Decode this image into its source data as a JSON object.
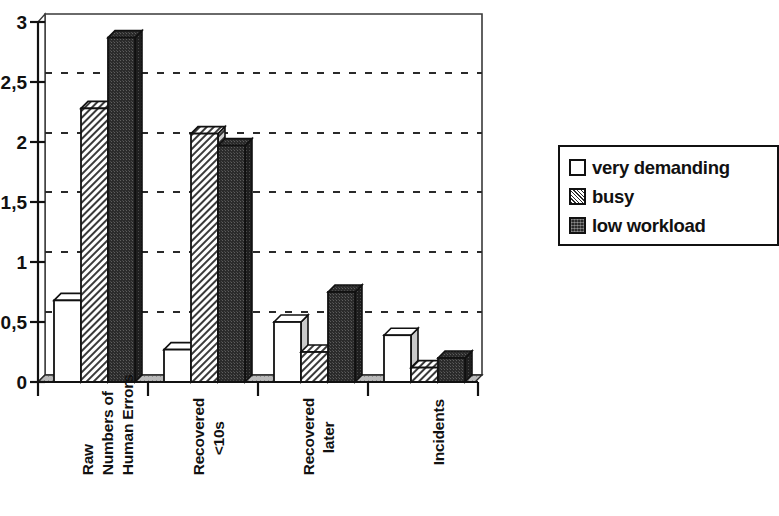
{
  "chart_data": {
    "type": "bar",
    "title": "",
    "subtitle": "",
    "xlabel": "",
    "ylabel": "",
    "ylim": [
      0,
      3
    ],
    "ytick_values": [
      0,
      0.5,
      1,
      1.5,
      2,
      2.5,
      3
    ],
    "ytick_labels": [
      "0",
      "0,5",
      "1",
      "1,5",
      "2",
      "2,5",
      "3"
    ],
    "decimal_separator": ",",
    "grid": "horizontal-dashed",
    "style": "3d-clustered-column",
    "legend_position": "right",
    "categories": [
      "Raw\nNumbers of\nHuman Errors",
      "Recovered\n<10s",
      "Recovered\nlater",
      "Incidents"
    ],
    "category_lines": [
      [
        "Raw",
        "Numbers of",
        "Human Errors"
      ],
      [
        "Recovered",
        "<10s"
      ],
      [
        "Recovered",
        "later"
      ],
      [
        "Incidents"
      ]
    ],
    "series": [
      {
        "name": "very demanding",
        "fill": "white",
        "color": "#ffffff",
        "values": [
          0.68,
          0.27,
          0.5,
          0.39
        ]
      },
      {
        "name": "busy",
        "fill": "diagonal-hatch",
        "color": "#d9d9d9",
        "values": [
          2.28,
          2.07,
          0.25,
          0.12
        ]
      },
      {
        "name": "low workload",
        "fill": "solid-dark",
        "color": "#2b2b2b",
        "values": [
          2.87,
          1.97,
          0.75,
          0.2
        ]
      }
    ]
  },
  "legend": {
    "items": [
      {
        "label": "very demanding",
        "swatch": "swatch-white"
      },
      {
        "label": "busy",
        "swatch": "swatch-hatched"
      },
      {
        "label": "low workload",
        "swatch": "swatch-dark"
      }
    ]
  },
  "colors": {
    "ink": "#111111",
    "bar_white": "#ffffff",
    "bar_hatch": "#d9d9d9",
    "bar_dark": "#2b2b2b",
    "grid": "#2a2a2a",
    "background": "#ffffff"
  }
}
